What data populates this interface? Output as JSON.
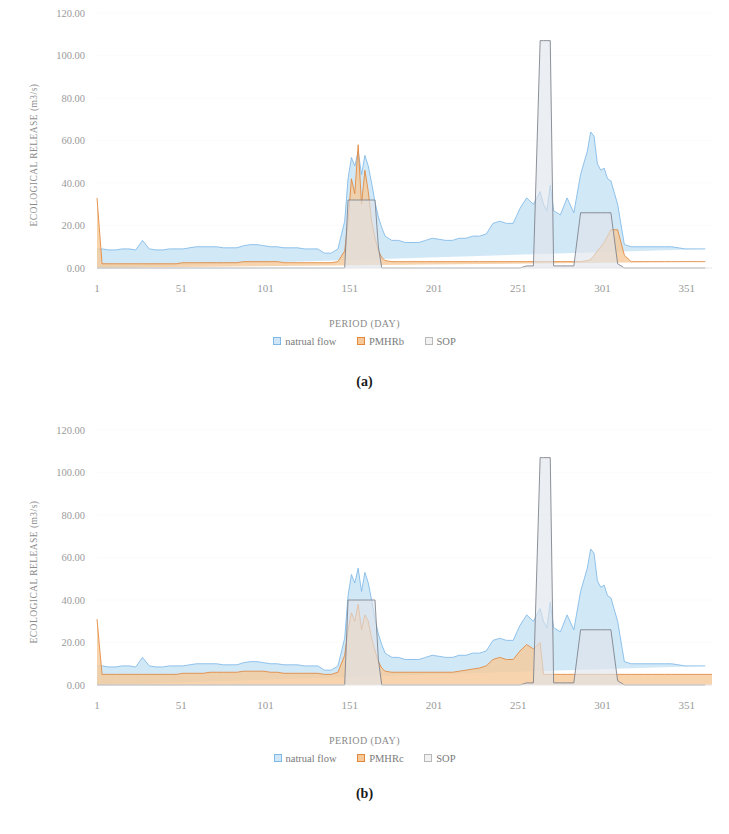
{
  "figure": {
    "panels": [
      {
        "label": "(a)",
        "y_axis_title": "ECOLOGICAL RELEASE (m3/s)",
        "x_axis_title": "PERIOD (DAY)",
        "legend": [
          {
            "name": "natrual flow",
            "color": "#cfe7f7",
            "border": "#7fb9e8"
          },
          {
            "name": "PMHRb",
            "color": "#f5c99a",
            "border": "#e2873c"
          },
          {
            "name": "SOP",
            "color": "#f2f2f2",
            "border": "#b8b8b8"
          }
        ]
      },
      {
        "label": "(b)",
        "y_axis_title": "ECOLOGICAL RELEASE (m3/s)",
        "x_axis_title": "PERIOD (DAY)",
        "legend": [
          {
            "name": "natrual flow",
            "color": "#cfe7f7",
            "border": "#7fb9e8"
          },
          {
            "name": "PMHRc",
            "color": "#f5c99a",
            "border": "#e2873c"
          },
          {
            "name": "SOP",
            "color": "#f2f2f2",
            "border": "#b8b8b8"
          }
        ]
      }
    ]
  },
  "chart_data": [
    {
      "type": "area",
      "title": "(a)",
      "xlabel": "PERIOD (DAY)",
      "ylabel": "ECOLOGICAL RELEASE (m3/s)",
      "xlim": [
        1,
        366
      ],
      "ylim": [
        0,
        120
      ],
      "yticks": [
        0,
        20,
        40,
        60,
        80,
        100,
        120
      ],
      "ytick_labels": [
        "0.00",
        "20.00",
        "40.00",
        "60.00",
        "80.00",
        "100.00",
        "120.00"
      ],
      "xticks": [
        1,
        51,
        101,
        151,
        201,
        251,
        301,
        351
      ],
      "xtick_labels": [
        "1",
        "51",
        "101",
        "151",
        "201",
        "251",
        "301",
        "351"
      ],
      "grid": false,
      "legend_position": "bottom",
      "x": [
        1,
        4,
        8,
        12,
        16,
        20,
        24,
        28,
        32,
        36,
        40,
        44,
        48,
        52,
        56,
        60,
        64,
        68,
        72,
        76,
        80,
        84,
        88,
        92,
        96,
        100,
        104,
        108,
        112,
        116,
        120,
        124,
        128,
        132,
        136,
        140,
        144,
        148,
        150,
        152,
        154,
        156,
        158,
        160,
        162,
        164,
        166,
        168,
        170,
        172,
        176,
        180,
        184,
        188,
        192,
        196,
        200,
        204,
        208,
        212,
        216,
        220,
        224,
        228,
        232,
        236,
        240,
        244,
        248,
        252,
        256,
        260,
        264,
        266,
        268,
        270,
        272,
        276,
        280,
        284,
        288,
        292,
        294,
        296,
        298,
        300,
        302,
        304,
        306,
        310,
        314,
        318,
        322,
        326,
        330,
        334,
        338,
        342,
        346,
        350,
        354,
        358,
        362,
        366
      ],
      "series": [
        {
          "name": "natrual flow",
          "color": "#cfe7f7",
          "line_color": "#7fb9e8",
          "values": [
            9,
            9,
            8.5,
            8.5,
            9,
            9,
            8.5,
            13,
            9,
            8.5,
            8.5,
            9,
            9,
            9,
            9.5,
            10,
            10,
            10,
            10,
            9.5,
            9.5,
            9.5,
            10.5,
            11,
            11,
            10.5,
            10,
            10,
            9.5,
            9.5,
            9.5,
            9,
            9,
            9,
            7,
            7,
            9,
            22,
            42,
            52,
            48,
            55,
            44,
            53,
            48,
            40,
            31,
            24,
            19,
            15,
            13,
            13,
            12,
            12,
            12,
            13,
            14,
            13.5,
            13,
            13,
            14,
            14,
            15,
            15,
            16,
            21,
            22,
            21,
            21,
            28,
            33,
            30,
            36,
            30,
            27,
            39,
            27,
            25,
            33,
            26,
            44,
            55,
            64,
            62,
            49,
            46,
            47,
            42,
            41,
            30,
            11,
            10,
            10,
            10,
            10,
            10,
            10,
            10,
            9.5,
            9,
            9,
            9,
            9
          ]
        },
        {
          "name": "PMHRb",
          "color": "#f5c99a",
          "line_color": "#e2873c",
          "values": [
            33,
            2,
            2,
            2,
            2,
            2,
            2,
            2,
            2,
            2,
            2,
            2,
            2,
            2.5,
            2.5,
            2.5,
            2.5,
            2.5,
            2.5,
            2.5,
            2.5,
            2.5,
            3,
            3,
            3,
            3,
            3,
            3,
            2.5,
            2.5,
            2.5,
            2.5,
            2.5,
            2.5,
            2.5,
            2.5,
            3,
            8,
            22,
            42,
            35,
            58,
            30,
            46,
            36,
            22,
            14,
            8,
            5,
            3.5,
            3,
            3,
            3,
            3,
            3,
            3,
            3,
            3,
            3,
            3,
            3,
            3,
            3,
            3,
            3,
            3,
            3,
            3,
            3,
            3,
            3,
            3,
            3,
            3,
            3,
            3,
            3,
            3,
            3,
            3,
            3,
            3.5,
            4,
            6,
            8,
            10,
            12,
            15,
            18,
            18,
            6,
            3,
            3,
            3,
            3,
            3,
            3,
            3,
            3,
            3,
            3,
            3,
            3
          ]
        },
        {
          "name": "SOP",
          "color": "#dfe4ea",
          "line_color": "#7a7f8a",
          "values": [
            0,
            0,
            0,
            0,
            0,
            0,
            0,
            0,
            0,
            0,
            0,
            0,
            0,
            0,
            0,
            0,
            0,
            0,
            0,
            0,
            0,
            0,
            0,
            0,
            0,
            0,
            0,
            0,
            0,
            0,
            0,
            0,
            0,
            0,
            0,
            0,
            0,
            0,
            32,
            32,
            32,
            32,
            32,
            32,
            32,
            32,
            32,
            10,
            0,
            0,
            0,
            0,
            0,
            0,
            0,
            0,
            0,
            0,
            0,
            0,
            0,
            0,
            0,
            0,
            0,
            0,
            0,
            0,
            0,
            0,
            1,
            1,
            107,
            107,
            107,
            107,
            1,
            1,
            1,
            1,
            26,
            26,
            26,
            26,
            26,
            26,
            26,
            26,
            26,
            2,
            0,
            0,
            0,
            0,
            0,
            0,
            0,
            0,
            0,
            0,
            0,
            0,
            0
          ]
        }
      ]
    },
    {
      "type": "area",
      "title": "(b)",
      "xlabel": "PERIOD (DAY)",
      "ylabel": "ECOLOGICAL RELEASE (m3/s)",
      "xlim": [
        1,
        366
      ],
      "ylim": [
        0,
        120
      ],
      "yticks": [
        0,
        20,
        40,
        60,
        80,
        100,
        120
      ],
      "ytick_labels": [
        "0.00",
        "20.00",
        "40.00",
        "60.00",
        "80.00",
        "100.00",
        "120.00"
      ],
      "xticks": [
        1,
        51,
        101,
        151,
        201,
        251,
        301,
        351
      ],
      "xtick_labels": [
        "1",
        "51",
        "101",
        "151",
        "201",
        "251",
        "301",
        "351"
      ],
      "grid": false,
      "legend_position": "bottom",
      "x": [
        1,
        4,
        8,
        12,
        16,
        20,
        24,
        28,
        32,
        36,
        40,
        44,
        48,
        52,
        56,
        60,
        64,
        68,
        72,
        76,
        80,
        84,
        88,
        92,
        96,
        100,
        104,
        108,
        112,
        116,
        120,
        124,
        128,
        132,
        136,
        140,
        144,
        148,
        150,
        152,
        154,
        156,
        158,
        160,
        162,
        164,
        166,
        168,
        170,
        172,
        176,
        180,
        184,
        188,
        192,
        196,
        200,
        204,
        208,
        212,
        216,
        220,
        224,
        228,
        232,
        236,
        240,
        244,
        248,
        252,
        256,
        260,
        264,
        266,
        268,
        270,
        272,
        276,
        280,
        284,
        288,
        292,
        294,
        296,
        298,
        300,
        302,
        304,
        306,
        310,
        314,
        318,
        322,
        326,
        330,
        334,
        338,
        342,
        346,
        350,
        354,
        358,
        362,
        366
      ],
      "series": [
        {
          "name": "natrual flow",
          "color": "#cfe7f7",
          "line_color": "#7fb9e8",
          "values": [
            9,
            9,
            8.5,
            8.5,
            9,
            9,
            8.5,
            13,
            9,
            8.5,
            8.5,
            9,
            9,
            9,
            9.5,
            10,
            10,
            10,
            10,
            9.5,
            9.5,
            9.5,
            10.5,
            11,
            11,
            10.5,
            10,
            10,
            9.5,
            9.5,
            9.5,
            9,
            9,
            9,
            7,
            7,
            9,
            22,
            42,
            52,
            48,
            55,
            44,
            53,
            48,
            40,
            31,
            24,
            19,
            15,
            13,
            13,
            12,
            12,
            12,
            13,
            14,
            13.5,
            13,
            13,
            14,
            14,
            15,
            15,
            16,
            21,
            22,
            21,
            21,
            28,
            33,
            30,
            36,
            30,
            27,
            39,
            27,
            25,
            33,
            26,
            44,
            55,
            64,
            62,
            49,
            46,
            47,
            42,
            41,
            30,
            11,
            10,
            10,
            10,
            10,
            10,
            10,
            10,
            9.5,
            9,
            9,
            9,
            9
          ]
        },
        {
          "name": "PMHRc",
          "color": "#f5c99a",
          "line_color": "#e2873c",
          "values": [
            31,
            5,
            5,
            5,
            5,
            5,
            5,
            5,
            5,
            5,
            5,
            5,
            5,
            5.5,
            5.5,
            5.5,
            5.5,
            6,
            6,
            6,
            6,
            6,
            6.5,
            6.5,
            6.5,
            6.5,
            6,
            6,
            5.5,
            5.5,
            5.5,
            5.5,
            5.5,
            5.5,
            5,
            5,
            6,
            14,
            26,
            34,
            30,
            38,
            26,
            33,
            30,
            22,
            16,
            11,
            8,
            6.5,
            6,
            6,
            6,
            6,
            6,
            6,
            6,
            6,
            6,
            6,
            6.5,
            7,
            7.5,
            8,
            9,
            12,
            13,
            12,
            12,
            16,
            19,
            17,
            20,
            5,
            5,
            5,
            5,
            5,
            5,
            5,
            5,
            5,
            5,
            5,
            5,
            5,
            5,
            5,
            5,
            5,
            5,
            5,
            5,
            5,
            5,
            5,
            5,
            5,
            5,
            5,
            5,
            5,
            5,
            5
          ]
        },
        {
          "name": "SOP",
          "color": "#dfe4ea",
          "line_color": "#7a7f8a",
          "values": [
            0,
            0,
            0,
            0,
            0,
            0,
            0,
            0,
            0,
            0,
            0,
            0,
            0,
            0,
            0,
            0,
            0,
            0,
            0,
            0,
            0,
            0,
            0,
            0,
            0,
            0,
            0,
            0,
            0,
            0,
            0,
            0,
            0,
            0,
            0,
            0,
            0,
            0,
            40,
            40,
            40,
            40,
            40,
            40,
            40,
            40,
            40,
            12,
            0,
            0,
            0,
            0,
            0,
            0,
            0,
            0,
            0,
            0,
            0,
            0,
            0,
            0,
            0,
            0,
            0,
            0,
            0,
            0,
            0,
            0,
            1,
            1,
            107,
            107,
            107,
            107,
            1,
            1,
            1,
            1,
            26,
            26,
            26,
            26,
            26,
            26,
            26,
            26,
            26,
            2,
            0,
            0,
            0,
            0,
            0,
            0,
            0,
            0,
            0,
            0,
            0,
            0,
            0
          ]
        }
      ]
    }
  ]
}
